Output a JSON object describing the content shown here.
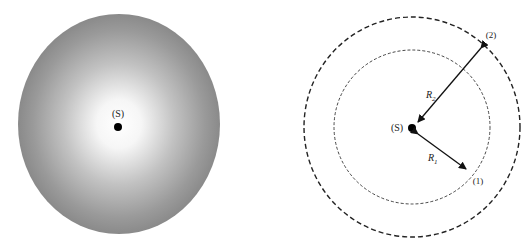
{
  "figure": {
    "left_panel": {
      "description": "Shaded sphere of radiation around point source",
      "source_label": "(S)",
      "colors": {
        "center": "#ffffff",
        "edge": "#8a8a8a"
      }
    },
    "right_panel": {
      "description": "Two concentric dashed spheres around point source",
      "source_label": "(S)",
      "inner_point_label": "(1)",
      "outer_point_label": "(2)",
      "inner_radius_label": "R",
      "inner_radius_subscript": "1",
      "outer_radius_label": "R",
      "outer_radius_subscript": "2"
    }
  }
}
